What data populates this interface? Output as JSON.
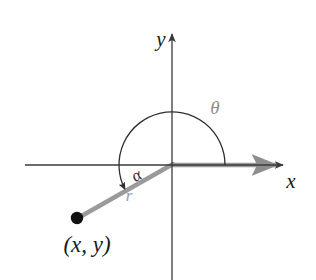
{
  "figure": {
    "type": "math-diagram",
    "canvas": {
      "width": 316,
      "height": 280,
      "background": "#ffffff"
    },
    "colors": {
      "axis": "#3a3a3a",
      "arc": "#2e2e2e",
      "ray": "#9a9a9a",
      "point": "#111111",
      "label_dark": "#1a1a1a",
      "label_gray": "#8d8d8d"
    },
    "axes": {
      "origin": {
        "x": 172,
        "y": 165
      },
      "x_axis": {
        "from_x": 25,
        "to_x": 288,
        "y": 165,
        "arrow": "right"
      },
      "y_axis": {
        "x": 172,
        "from_y": 280,
        "to_y": 30,
        "arrow": "up"
      },
      "x_label": "x",
      "y_label": "y"
    },
    "labels": {
      "theta": "θ",
      "alpha": "α",
      "r": "r",
      "point": "(x, y)"
    },
    "arc": {
      "radius": 53,
      "start_angle_deg": 0,
      "end_angle_deg": 207,
      "direction": "counterclockwise",
      "arrowhead": "end"
    },
    "ray": {
      "angle_deg": 207,
      "length": 106,
      "initial_side": "positive x-axis",
      "terminal_point": {
        "x": 77,
        "y": 218
      }
    }
  }
}
